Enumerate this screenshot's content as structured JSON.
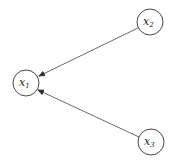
{
  "diagram": {
    "type": "directed-graph",
    "nodes": [
      {
        "id": "x1",
        "base": "x",
        "sub": "1",
        "cx": 26,
        "cy": 83,
        "r": 13
      },
      {
        "id": "x2",
        "base": "x",
        "sub": "2",
        "cx": 150,
        "cy": 22,
        "r": 13
      },
      {
        "id": "x3",
        "base": "x",
        "sub": "3",
        "cx": 151,
        "cy": 142,
        "r": 13
      }
    ],
    "edges": [
      {
        "from": "x2",
        "to": "x1"
      },
      {
        "from": "x3",
        "to": "x1"
      }
    ],
    "colors": {
      "stroke": "#333333",
      "background": "#ffffff"
    }
  }
}
